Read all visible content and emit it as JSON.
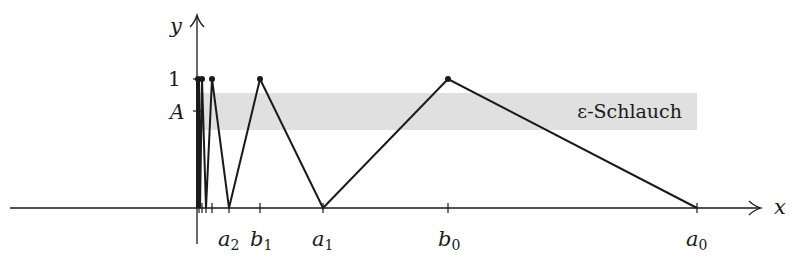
{
  "figure": {
    "axes": {
      "x_label": "x",
      "y_label": "y",
      "y_ticks": [
        {
          "label": "1",
          "value": 1
        },
        {
          "label": "A",
          "value": "A"
        }
      ],
      "x_ticks": [
        {
          "label": "a",
          "sub": "2",
          "name": "a2"
        },
        {
          "label": "b",
          "sub": "1",
          "name": "b1"
        },
        {
          "label": "a",
          "sub": "1",
          "name": "a1"
        },
        {
          "label": "b",
          "sub": "0",
          "name": "b0"
        },
        {
          "label": "a",
          "sub": "0",
          "name": "a0"
        }
      ]
    },
    "band": {
      "label": "ε-Schlauch",
      "color": "#e0e0e0"
    },
    "line_color": "#1a1a1a",
    "points": [
      {
        "name": "a0",
        "x": 697,
        "y": 208
      },
      {
        "name": "b0",
        "x": 448,
        "y": 79,
        "dot": true
      },
      {
        "name": "a1",
        "x": 323,
        "y": 208
      },
      {
        "name": "b1",
        "x": 260,
        "y": 79,
        "dot": true
      },
      {
        "name": "a2",
        "x": 229,
        "y": 208
      },
      {
        "name": "b2",
        "x": 212,
        "y": 79,
        "dot": true
      },
      {
        "name": "a3",
        "x": 206,
        "y": 208
      },
      {
        "name": "b3",
        "x": 202,
        "y": 79,
        "dot": true
      },
      {
        "name": "a4",
        "x": 200,
        "y": 208
      },
      {
        "name": "b4",
        "x": 199,
        "y": 79,
        "dot": true
      },
      {
        "name": "a5",
        "x": 198,
        "y": 208
      },
      {
        "name": "b5",
        "x": 197.5,
        "y": 79,
        "dot": true
      }
    ]
  }
}
